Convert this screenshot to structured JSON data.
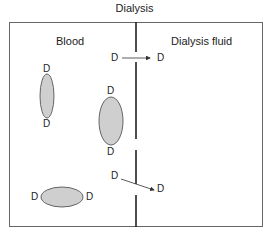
{
  "diagram": {
    "title": "Dialysis",
    "compartments": {
      "left": "Blood",
      "right": "Dialysis fluid"
    },
    "molecule_label": "D",
    "colors": {
      "outline": "#555555",
      "membrane": "#222222",
      "ellipse_fill": "#cfcfcf",
      "ellipse_stroke": "#444444"
    }
  }
}
